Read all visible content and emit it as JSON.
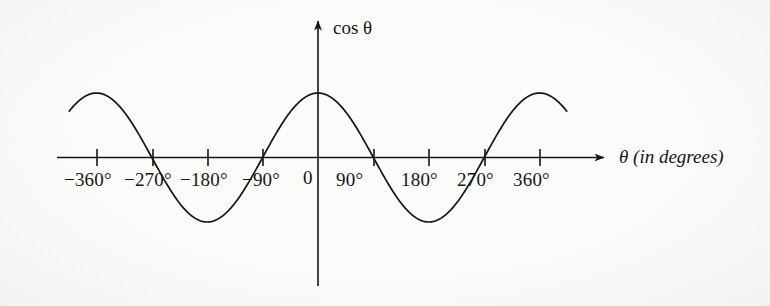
{
  "figure": {
    "background_color": "#fbfbf9",
    "ink_color": "#161616",
    "axis_label_x": "θ (in degrees)",
    "axis_label_y": "cos θ",
    "origin_label": "0"
  },
  "chart_data": {
    "type": "line",
    "title": "",
    "subtitle": "",
    "xlabel": "θ (in degrees)",
    "ylabel": "cos θ",
    "grid": false,
    "legend": "none",
    "xlim": [
      -420,
      420
    ],
    "ylim": [
      -1.25,
      1.25
    ],
    "xticks": [
      -360,
      -270,
      -180,
      -90,
      0,
      90,
      180,
      270,
      360
    ],
    "xtick_labels": [
      "−360°",
      "−270°",
      "−180°",
      "−90°",
      "0",
      "90°",
      "180°",
      "270°",
      "360°"
    ],
    "yticks": [],
    "ytick_labels": [],
    "series": [
      {
        "name": "cos θ",
        "function": "y = cos(θ)",
        "x_start": -404,
        "x_end": 404,
        "x": [
          -404,
          -390,
          -360,
          -330,
          -300,
          -270,
          -240,
          -210,
          -180,
          -150,
          -120,
          -90,
          -60,
          -30,
          0,
          30,
          60,
          90,
          120,
          150,
          180,
          210,
          240,
          270,
          300,
          330,
          360,
          390,
          404
        ],
        "values": [
          0.82,
          0.94,
          1.0,
          0.87,
          0.5,
          0.0,
          -0.5,
          -0.87,
          -1.0,
          -0.87,
          -0.5,
          0.0,
          0.5,
          0.87,
          1.0,
          0.87,
          0.5,
          0.0,
          -0.5,
          -0.87,
          -1.0,
          -0.87,
          -0.5,
          0.0,
          0.5,
          0.87,
          1.0,
          0.94,
          0.82
        ]
      }
    ],
    "zero_crossings": [
      -270,
      -90,
      90,
      270
    ],
    "maxima": [
      {
        "x": -360,
        "y": 1
      },
      {
        "x": 0,
        "y": 1
      },
      {
        "x": 360,
        "y": 1
      }
    ],
    "minima": [
      {
        "x": -180,
        "y": -1
      },
      {
        "x": 180,
        "y": -1
      }
    ]
  },
  "tick_labels": [
    {
      "text": "−360°",
      "x": 97
    },
    {
      "text": "−270°",
      "x": 153
    },
    {
      "text": "−180°",
      "x": 208
    },
    {
      "text": "−90°",
      "x": 263
    },
    {
      "text": "0",
      "x": 318
    },
    {
      "text": "90°",
      "x": 374
    },
    {
      "text": "180°",
      "x": 429
    },
    {
      "text": "270°",
      "x": 485
    },
    {
      "text": "360°",
      "x": 540
    }
  ]
}
